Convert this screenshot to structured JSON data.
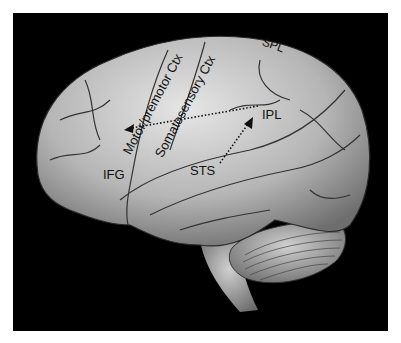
{
  "figure": {
    "background_color": "#000000",
    "brain_color": "#bdbdbd",
    "labels": [
      {
        "id": "spl",
        "text": "SPL"
      },
      {
        "id": "ipl",
        "text": "IPL"
      },
      {
        "id": "ifg",
        "text": "IFG"
      },
      {
        "id": "sts",
        "text": "STS"
      },
      {
        "id": "motor",
        "text": "Motor/premotor Ctx"
      },
      {
        "id": "somato",
        "text": "Somatosensory Ctx"
      }
    ],
    "arrows": [
      {
        "from": "IPL",
        "to": "IFG",
        "style": "dotted"
      },
      {
        "from": "STS",
        "to": "IPL",
        "style": "dotted"
      }
    ]
  }
}
